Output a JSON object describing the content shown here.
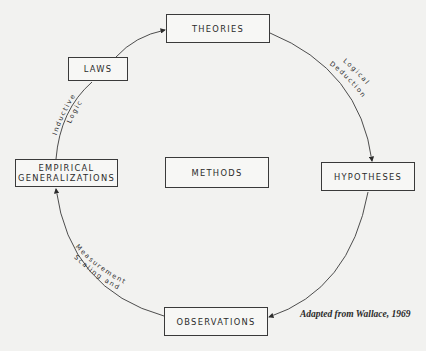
{
  "diagram": {
    "nodes": {
      "theories": "THEORIES",
      "laws": "LAWS",
      "empirical_line1": "EMPIRICAL",
      "empirical_line2": "GENERALIZATIONS",
      "methods": "METHODS",
      "hypotheses": "HYPOTHESES",
      "observations": "OBSERVATIONS"
    },
    "edges": {
      "logical": "Logical",
      "deduction": "Deduction",
      "inductive": "Inductive",
      "logic": "Logic",
      "scaling_and": "Scaling and",
      "measurement": "Measurement"
    },
    "cycle_order": [
      "THEORIES",
      "HYPOTHESES",
      "OBSERVATIONS",
      "EMPIRICAL GENERALIZATIONS",
      "LAWS",
      "THEORIES"
    ],
    "credit": "Adapted from Wallace, 1969",
    "colors": {
      "background": "#f2f2f0",
      "ink": "#2b2b2b"
    }
  }
}
